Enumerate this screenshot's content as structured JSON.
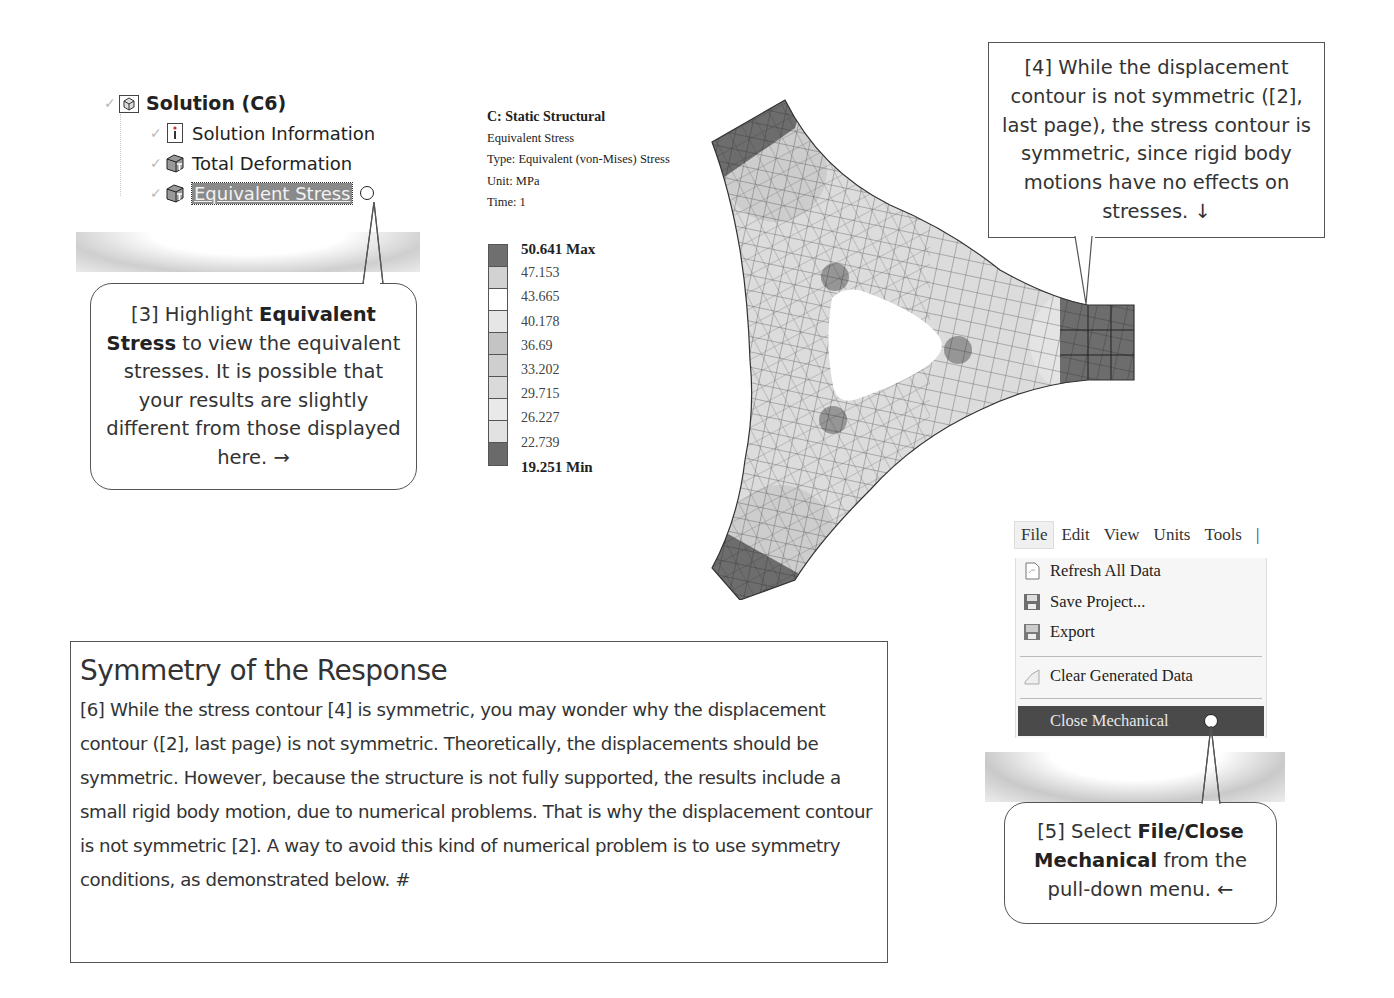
{
  "tree": {
    "root": {
      "label": "Solution (C6)",
      "icon": "solution-icon"
    },
    "children": [
      {
        "label": "Solution Information",
        "icon": "info-icon",
        "selected": false
      },
      {
        "label": "Total Deformation",
        "icon": "result-icon",
        "selected": false
      },
      {
        "label": "Equivalent Stress",
        "icon": "result-icon",
        "selected": true
      }
    ]
  },
  "callouts": {
    "step3": {
      "num": "[3] Highlight ",
      "bold": "Equivalent Stress",
      "rest": " to view the equivalent stresses.  It is possible that your results are slightly different from those displayed here. →"
    },
    "step4": {
      "text": "[4] While the displacement contour is not symmetric ([2], last page), the stress contour is symmetric, since rigid body motions have no effects on stresses. ↓"
    },
    "step5": {
      "num": "[5] Select ",
      "bold": "File/Close Mechanical",
      "rest": " from the pull-down menu. ←"
    }
  },
  "result": {
    "title": "C: Static Structural",
    "name": "Equivalent Stress",
    "type": "Type: Equivalent (von-Mises) Stress",
    "unit": "Unit: MPa",
    "time": "Time: 1"
  },
  "legend": {
    "labels": [
      "50.641 Max",
      "47.153",
      "43.665",
      "40.178",
      "36.69",
      "33.202",
      "29.715",
      "26.227",
      "22.739",
      "19.251 Min"
    ],
    "colors": [
      "#6f6f6f",
      "#d2d2d2",
      "#ffffff",
      "#e6e6e6",
      "#c4c4c4",
      "#cfcfcf",
      "#dadada",
      "#e9e9e9",
      "#e2e2e2",
      "#6a6a6a"
    ]
  },
  "menu": {
    "bar": [
      "File",
      "Edit",
      "View",
      "Units",
      "Tools",
      "|"
    ],
    "items": [
      {
        "label": "Refresh All Data",
        "icon": "refresh-icon"
      },
      {
        "label": "Save Project...",
        "icon": "save-icon"
      },
      {
        "label": "Export",
        "icon": "export-icon"
      },
      {
        "label": "Clear Generated Data",
        "icon": "clear-icon"
      },
      {
        "label": "Close Mechanical",
        "highlighted": true
      }
    ]
  },
  "section": {
    "title": "Symmetry of the Response",
    "body": "[6] While the stress contour [4] is symmetric, you may wonder why the displacement contour ([2], last page) is not symmetric.  Theoretically, the displacements should be symmetric.  However, because the structure is not fully supported, the results include a small rigid body motion, due to numerical problems. That is why the displacement contour is not symmetric [2].  A way to avoid this kind of numerical problem is to use symmetry conditions, as demonstrated below.  #"
  }
}
